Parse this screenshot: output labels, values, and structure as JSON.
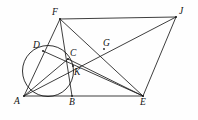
{
  "figure": {
    "type": "geometry-diagram",
    "canvas": {
      "width": 198,
      "height": 120
    },
    "stroke_color": "#1c1c1c",
    "background_color": "#fefefe",
    "points": [
      {
        "id": "F",
        "label": "F",
        "x": 60,
        "y": 19,
        "label_dx": -8,
        "label_dy": -11
      },
      {
        "id": "J",
        "label": "J",
        "x": 176,
        "y": 17,
        "label_dx": 3,
        "label_dy": -10
      },
      {
        "id": "D",
        "label": "D",
        "x": 43,
        "y": 51,
        "label_dx": -10,
        "label_dy": -10
      },
      {
        "id": "C",
        "label": "C",
        "x": 68,
        "y": 59,
        "label_dx": 2,
        "label_dy": -10
      },
      {
        "id": "G",
        "label": "G",
        "x": 104,
        "y": 49,
        "label_dx": -1,
        "label_dy": -10
      },
      {
        "id": "K",
        "label": "K",
        "x": 73,
        "y": 66,
        "label_dx": 1,
        "label_dy": 2
      },
      {
        "id": "A",
        "label": "A",
        "x": 24,
        "y": 96,
        "label_dx": -10,
        "label_dy": 1
      },
      {
        "id": "B",
        "label": "B",
        "x": 72,
        "y": 96,
        "label_dx": -3,
        "label_dy": 2
      },
      {
        "id": "E",
        "label": "E",
        "x": 143,
        "y": 96,
        "label_dx": -3,
        "label_dy": 2
      }
    ],
    "circle": {
      "cx": 48,
      "cy": 71,
      "r": 25.5
    },
    "segments": [
      {
        "id": "FJ",
        "from": "F",
        "to": "J"
      },
      {
        "id": "AE",
        "from": "A",
        "to": "E"
      },
      {
        "id": "JE",
        "from": "J",
        "to": "E"
      },
      {
        "id": "AF",
        "from": "A",
        "to": "F"
      },
      {
        "id": "FE",
        "from": "F",
        "to": "E"
      },
      {
        "id": "FB",
        "from": "F",
        "to": "B"
      },
      {
        "id": "AJ",
        "from": "A",
        "to": "J"
      },
      {
        "id": "AC",
        "from": "A",
        "to": "C"
      },
      {
        "id": "CE",
        "from": "C",
        "to": "E"
      },
      {
        "id": "DE",
        "from": "D",
        "to": "E"
      }
    ]
  }
}
